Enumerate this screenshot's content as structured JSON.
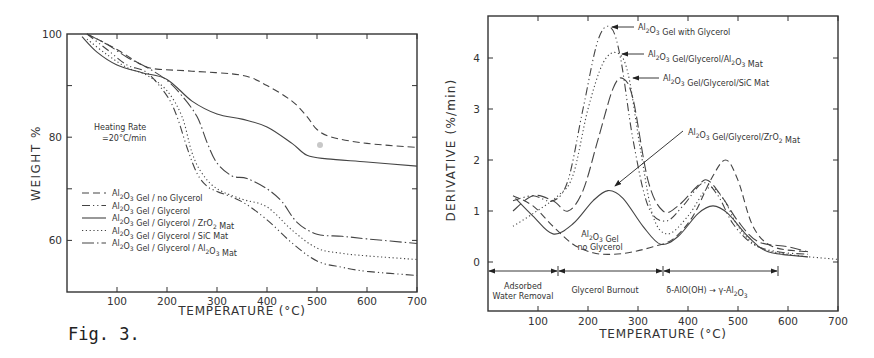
{
  "figure": {
    "caption": "Fig. 3."
  },
  "chart_data": [
    {
      "type": "line",
      "title": "",
      "xlabel": "TEMPERATURE (°C)",
      "ylabel": "WEIGHT %",
      "xlim": [
        0,
        700
      ],
      "ylim": [
        50,
        100
      ],
      "xticks": [
        100,
        200,
        300,
        400,
        500,
        600,
        700
      ],
      "yticks": [
        60,
        80,
        100
      ],
      "grid": false,
      "legend_position": "lower-left inside",
      "annotation": [
        "Heating Rate",
        "=20°C/min"
      ],
      "series": [
        {
          "name": "Al2O3 Gel / no Glycerol",
          "style": "dashed",
          "x": [
            40,
            100,
            150,
            180,
            250,
            350,
            400,
            450,
            480,
            500,
            530,
            600,
            700
          ],
          "y": [
            100,
            97,
            94,
            93.2,
            92.8,
            92,
            90,
            87,
            84,
            81.5,
            80,
            78.8,
            78
          ]
        },
        {
          "name": "Al2O3 Gel / Glycerol",
          "style": "dash-dot-dot",
          "x": [
            40,
            80,
            120,
            160,
            200,
            220,
            240,
            260,
            280,
            300,
            350,
            400,
            450,
            500,
            550,
            600,
            700
          ],
          "y": [
            100,
            97,
            94,
            92.5,
            88,
            84,
            78,
            73,
            70.5,
            69.5,
            67.5,
            64,
            59.5,
            56,
            54.8,
            54,
            53.2
          ]
        },
        {
          "name": "Al2O3 Gel / Glycerol / ZrO2 Mat",
          "style": "solid",
          "x": [
            30,
            60,
            100,
            150,
            200,
            250,
            300,
            350,
            400,
            450,
            480,
            520,
            600,
            700
          ],
          "y": [
            99.5,
            96.5,
            94,
            92.5,
            91.2,
            87,
            84.5,
            83.5,
            82,
            78.8,
            76.5,
            75.8,
            75.2,
            74.4
          ]
        },
        {
          "name": "Al2O3 Gel / Glycerol / SiC Mat",
          "style": "dotted",
          "x": [
            40,
            80,
            120,
            160,
            200,
            230,
            250,
            270,
            300,
            350,
            400,
            450,
            500,
            550,
            600,
            700
          ],
          "y": [
            99,
            96,
            93.5,
            92,
            89,
            84,
            77,
            73,
            70,
            68,
            66.5,
            62,
            58.5,
            57.5,
            57,
            56.3
          ]
        },
        {
          "name": "Al2O3 Gel / Glycerol / Al2O3 Mat",
          "style": "long-dash-dot",
          "x": [
            40,
            80,
            120,
            160,
            200,
            230,
            260,
            280,
            300,
            330,
            360,
            400,
            430,
            460,
            500,
            550,
            600,
            700
          ],
          "y": [
            100,
            98,
            95.5,
            93.5,
            91,
            88,
            84,
            79,
            75,
            72.5,
            72,
            70,
            67.5,
            63.5,
            61.2,
            60.8,
            60.3,
            59.4
          ]
        }
      ]
    },
    {
      "type": "line",
      "title": "",
      "xlabel": "TEMPERATURE (°C)",
      "ylabel": "DERIVATIVE (%/min)",
      "xlim": [
        0,
        700
      ],
      "ylim": [
        -0.95,
        4.8
      ],
      "xticks": [
        100,
        200,
        300,
        400,
        500,
        600,
        700
      ],
      "yticks": [
        0,
        1,
        2,
        3,
        4
      ],
      "grid": false,
      "series": [
        {
          "name": "Al2O3 Gel with Glycerol",
          "style": "dash-dot-dot",
          "x": [
            50,
            90,
            130,
            160,
            190,
            220,
            245,
            265,
            290,
            320,
            355,
            390,
            430,
            460,
            490,
            530,
            580,
            640
          ],
          "y": [
            1.2,
            1.3,
            1.2,
            1.6,
            3.0,
            4.35,
            4.6,
            4.0,
            2.4,
            1.1,
            0.8,
            1.1,
            1.55,
            1.3,
            0.75,
            0.35,
            0.2,
            0.15
          ]
        },
        {
          "name": "Al2O3 Gel / Glycerol / Al2O3 Mat",
          "style": "dotted",
          "x": [
            50,
            90,
            140,
            170,
            200,
            230,
            258,
            280,
            305,
            330,
            360,
            400,
            440,
            470,
            500,
            540,
            600,
            700
          ],
          "y": [
            0.7,
            0.95,
            1.3,
            1.7,
            3.0,
            3.9,
            4.1,
            3.7,
            2.2,
            0.9,
            0.55,
            0.9,
            1.45,
            1.25,
            0.7,
            0.3,
            0.15,
            0.05
          ]
        },
        {
          "name": "Al2O3 Gel / Glycerol / SiC Mat",
          "style": "long-dash",
          "x": [
            50,
            90,
            130,
            160,
            190,
            220,
            250,
            270,
            290,
            320,
            350,
            380,
            420,
            440,
            470,
            500,
            540,
            600,
            640
          ],
          "y": [
            1.0,
            1.3,
            1.2,
            1.0,
            1.4,
            2.4,
            3.4,
            3.6,
            3.2,
            1.6,
            1.0,
            1.1,
            1.5,
            1.6,
            1.25,
            0.8,
            0.4,
            0.3,
            0.2
          ]
        },
        {
          "name": "Al2O3 Gel / Glycerol / ZrO2 Mat",
          "style": "solid",
          "x": [
            55,
            90,
            130,
            170,
            210,
            240,
            270,
            310,
            345,
            380,
            420,
            450,
            480,
            520,
            560,
            640
          ],
          "y": [
            1.25,
            0.9,
            0.55,
            0.75,
            1.2,
            1.4,
            1.25,
            0.7,
            0.35,
            0.5,
            0.95,
            1.1,
            0.95,
            0.5,
            0.2,
            0.1
          ]
        },
        {
          "name": "Al2O3 Gel no Glycerol",
          "style": "dashed",
          "x": [
            50,
            90,
            130,
            170,
            210,
            250,
            290,
            330,
            370,
            410,
            445,
            475,
            500,
            530,
            570,
            640
          ],
          "y": [
            1.3,
            1.1,
            0.7,
            0.35,
            0.18,
            0.15,
            0.2,
            0.3,
            0.45,
            0.9,
            1.6,
            2.0,
            1.6,
            0.7,
            0.3,
            0.2
          ]
        }
      ],
      "annotations": [
        {
          "text": "Al2O3 Gel with Glycerol",
          "x": 245,
          "y": 4.6
        },
        {
          "text": "Al2O3 Gel/Glycerol/Al2O3 Mat",
          "x": 262,
          "y": 4.1
        },
        {
          "text": "Al2O3 Gel/Glycerol/SiC Mat",
          "x": 275,
          "y": 3.6
        },
        {
          "text": "Al2O3 Gel/Glycerol/ZrO2 Mat",
          "x": 240,
          "y": 1.45
        },
        {
          "text": "Al2O3 Gel no Glycerol",
          "x": 270,
          "y": 0.55
        }
      ],
      "regions": [
        {
          "label": "Adsorbed Water Removal",
          "from": 0,
          "to": 140
        },
        {
          "label": "Glycerol Burnout",
          "from": 140,
          "to": 350
        },
        {
          "label": "δ-AlO(OH) → γ-Al2O3",
          "from": 350,
          "to": 580
        }
      ]
    }
  ]
}
